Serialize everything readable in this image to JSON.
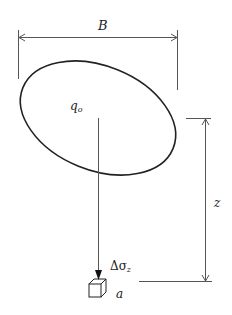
{
  "diagram": {
    "labels": {
      "width": "B",
      "load": "q",
      "load_sub": "o",
      "depth": "z",
      "stress_delta": "Δσ",
      "stress_sub": "z",
      "point": "a"
    },
    "colors": {
      "stroke": "#222222",
      "thin": "#555555",
      "background": "#ffffff"
    }
  }
}
